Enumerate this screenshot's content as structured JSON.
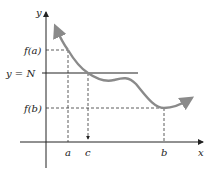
{
  "figure": {
    "colors": {
      "axis": "#222222",
      "curve": "#8a8a8a",
      "guide": "#333333",
      "background": "#ffffff"
    },
    "labels": {
      "y_axis": "y",
      "x_axis": "x",
      "fa": "f(a)",
      "fb": "f(b)",
      "yN": "y = N",
      "a": "a",
      "b": "b",
      "c": "c"
    }
  }
}
